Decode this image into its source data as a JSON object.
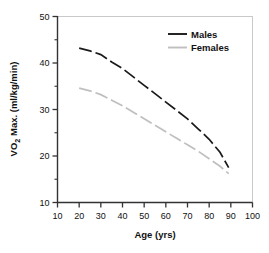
{
  "chart_data": {
    "type": "line",
    "title": "",
    "subtitle": "",
    "xlabel": "Age (yrs)",
    "ylabel": "VO2 Max. (ml/kg/min)",
    "ylabel_parts": {
      "pre": "VO",
      "sub": "2",
      "post": " Max. (ml/kg/min)"
    },
    "xlim": [
      10,
      100
    ],
    "ylim": [
      10,
      50
    ],
    "xticks": [
      10,
      20,
      30,
      40,
      50,
      60,
      70,
      80,
      90,
      100
    ],
    "yticks": [
      10,
      20,
      30,
      40,
      50
    ],
    "yminorticks": [
      15,
      25,
      35,
      45
    ],
    "xticklabels": [
      "10",
      "20",
      "30",
      "40",
      "50",
      "60",
      "70",
      "80",
      "90",
      "100"
    ],
    "yticklabels": [
      "10",
      "20",
      "30",
      "40",
      "50"
    ],
    "grid": false,
    "legend_position": "top-right",
    "linestyle": "dashed",
    "series": [
      {
        "name": "Males",
        "color": "#1a1a1a",
        "x": [
          20,
          25,
          30,
          35,
          40,
          45,
          50,
          55,
          60,
          65,
          70,
          75,
          80,
          85,
          89
        ],
        "values": [
          43.2,
          42.6,
          41.8,
          40.2,
          38.8,
          37.0,
          35.2,
          33.4,
          31.6,
          29.8,
          28.0,
          25.8,
          23.6,
          20.8,
          17.5
        ]
      },
      {
        "name": "Females",
        "color": "#bfbfbf",
        "x": [
          20,
          25,
          30,
          35,
          40,
          45,
          50,
          55,
          60,
          65,
          70,
          75,
          80,
          85,
          89
        ],
        "values": [
          34.6,
          34.0,
          33.2,
          32.0,
          30.8,
          29.4,
          28.0,
          26.6,
          25.2,
          23.8,
          22.4,
          21.0,
          19.4,
          17.8,
          16.2
        ]
      }
    ],
    "legend": [
      {
        "label": "Males",
        "color": "#1a1a1a"
      },
      {
        "label": "Females",
        "color": "#bfbfbf"
      }
    ]
  },
  "figure": {
    "frame_color": "#c9c9c9",
    "axis_color": "#333333",
    "background": "#ffffff"
  }
}
